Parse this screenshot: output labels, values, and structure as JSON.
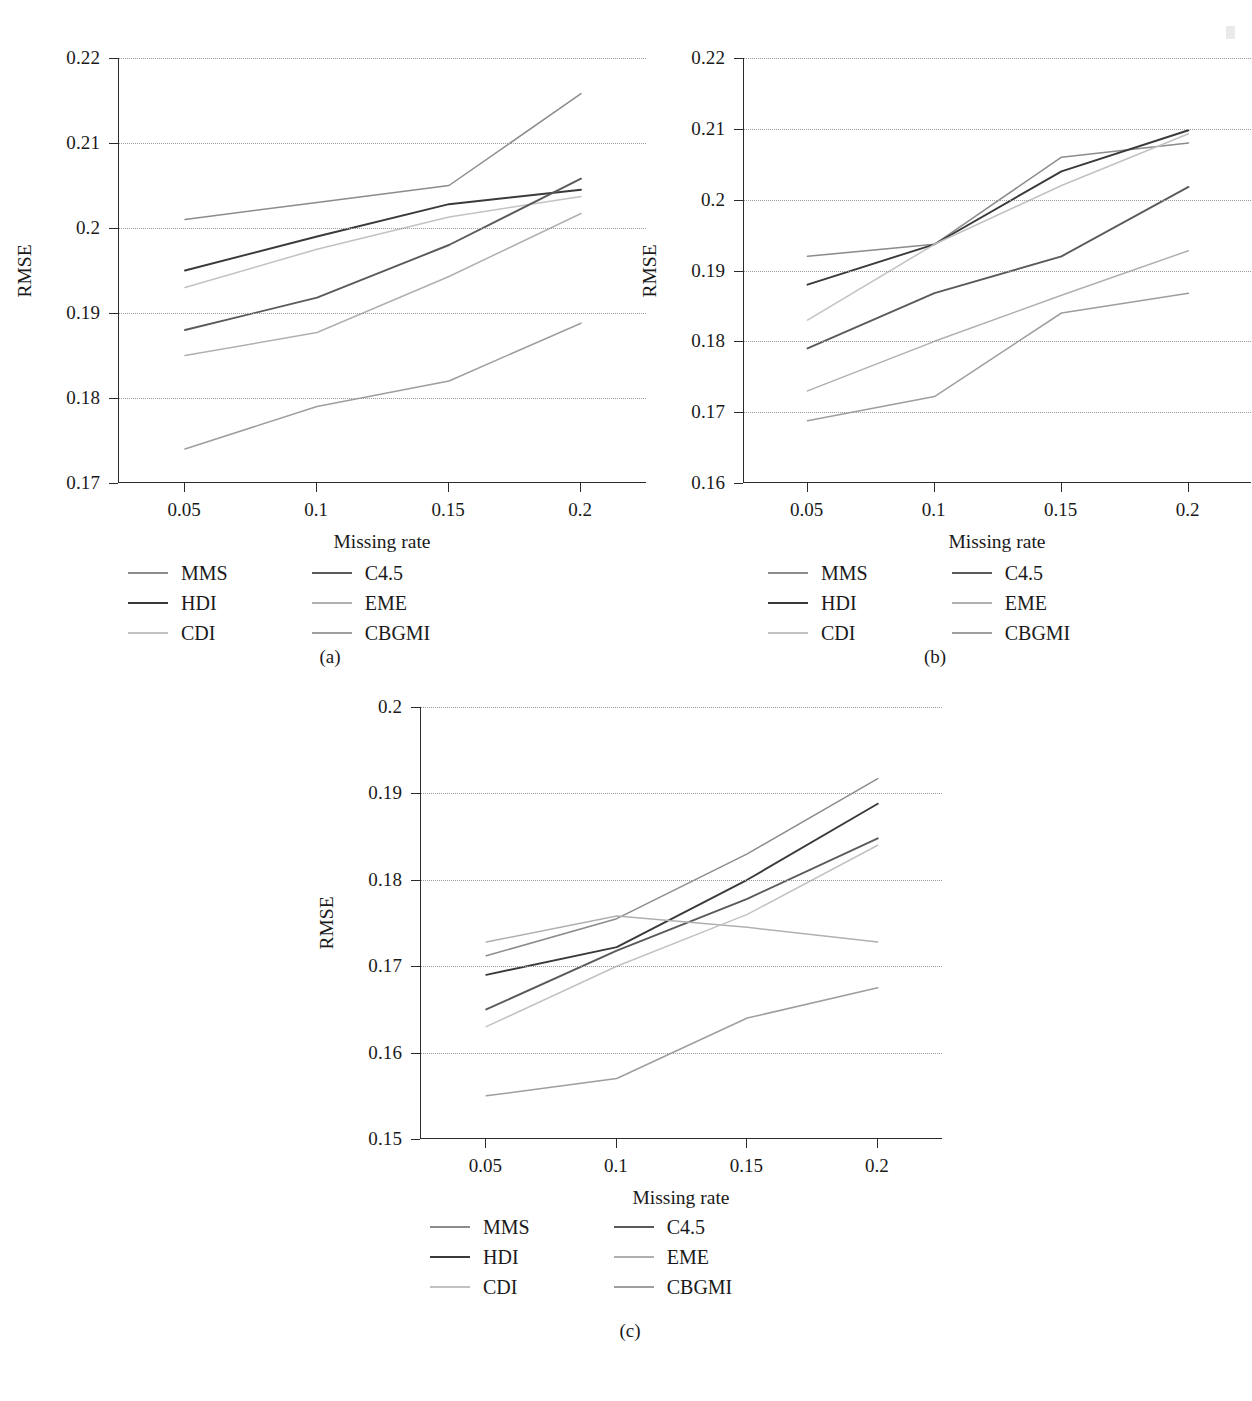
{
  "figure": {
    "axis_titles": {
      "x": "Missing rate",
      "y": "RMSE"
    },
    "series_names": [
      "MMS",
      "HDI",
      "CDI",
      "C4.5",
      "EME",
      "CBGMI"
    ],
    "series_colors": {
      "MMS": "#8c8c8c",
      "HDI": "#3a3a3a",
      "CDI": "#c2c2c2",
      "C4.5": "#5a5a5a",
      "EME": "#b0b0b0",
      "CBGMI": "#9e9e9e"
    },
    "legend": {
      "column_left": [
        "MMS",
        "HDI",
        "CDI"
      ],
      "column_right": [
        "C4.5",
        "EME",
        "CBGMI"
      ]
    },
    "captions": {
      "a": "(a)",
      "b": "(b)",
      "c": "(c)"
    }
  },
  "chart_data": [
    {
      "id": "a",
      "type": "line",
      "title": "",
      "caption": "(a)",
      "xlabel": "Missing rate",
      "ylabel": "RMSE",
      "x": [
        0.05,
        0.1,
        0.15,
        0.2
      ],
      "xtick_labels": [
        "0.05",
        "0.1",
        "0.15",
        "0.2"
      ],
      "xlim": [
        0.025,
        0.225
      ],
      "ylim": [
        0.17,
        0.22
      ],
      "ytick_labels": [
        "0.17",
        "0.18",
        "0.19",
        "0.2",
        "0.21",
        "0.22"
      ],
      "yticks": [
        0.17,
        0.18,
        0.19,
        0.2,
        0.21,
        0.22
      ],
      "grid": true,
      "grid_style": "dotted-horizontal",
      "legend_position": "below-plot",
      "series": [
        {
          "name": "MMS",
          "values": [
            0.201,
            0.203,
            0.205,
            0.2158
          ]
        },
        {
          "name": "HDI",
          "values": [
            0.195,
            0.199,
            0.2028,
            0.2045
          ]
        },
        {
          "name": "CDI",
          "values": [
            0.193,
            0.1975,
            0.2013,
            0.2037
          ]
        },
        {
          "name": "C4.5",
          "values": [
            0.188,
            0.1918,
            0.198,
            0.2058
          ]
        },
        {
          "name": "EME",
          "values": [
            0.185,
            0.1877,
            0.1943,
            0.2017
          ]
        },
        {
          "name": "CBGMI",
          "values": [
            0.174,
            0.179,
            0.182,
            0.1888
          ]
        }
      ]
    },
    {
      "id": "b",
      "type": "line",
      "title": "",
      "caption": "(b)",
      "xlabel": "Missing rate",
      "ylabel": "RMSE",
      "x": [
        0.05,
        0.1,
        0.15,
        0.2
      ],
      "xtick_labels": [
        "0.05",
        "0.1",
        "0.15",
        "0.2"
      ],
      "xlim": [
        0.025,
        0.225
      ],
      "ylim": [
        0.16,
        0.22
      ],
      "ytick_labels": [
        "0.16",
        "0.17",
        "0.18",
        "0.19",
        "0.2",
        "0.21",
        "0.22"
      ],
      "yticks": [
        0.16,
        0.17,
        0.18,
        0.19,
        0.2,
        0.21,
        0.22
      ],
      "grid": true,
      "grid_style": "dotted-horizontal",
      "legend_position": "below-plot",
      "series": [
        {
          "name": "MMS",
          "values": [
            0.192,
            0.1937,
            0.206,
            0.208
          ]
        },
        {
          "name": "HDI",
          "values": [
            0.188,
            0.1937,
            0.204,
            0.2098
          ]
        },
        {
          "name": "CDI",
          "values": [
            0.183,
            0.1937,
            0.202,
            0.2093
          ]
        },
        {
          "name": "C4.5",
          "values": [
            0.179,
            0.1868,
            0.192,
            0.2018
          ]
        },
        {
          "name": "EME",
          "values": [
            0.173,
            0.18,
            0.1865,
            0.1928
          ]
        },
        {
          "name": "CBGMI",
          "values": [
            0.1688,
            0.1722,
            0.184,
            0.1868
          ]
        }
      ]
    },
    {
      "id": "c",
      "type": "line",
      "title": "",
      "caption": "(c)",
      "xlabel": "Missing rate",
      "ylabel": "RMSE",
      "x": [
        0.05,
        0.1,
        0.15,
        0.2
      ],
      "xtick_labels": [
        "0.05",
        "0.1",
        "0.15",
        "0.2"
      ],
      "xlim": [
        0.025,
        0.225
      ],
      "ylim": [
        0.15,
        0.2
      ],
      "ytick_labels": [
        "0.15",
        "0.16",
        "0.17",
        "0.18",
        "0.19",
        "0.2"
      ],
      "yticks": [
        0.15,
        0.16,
        0.17,
        0.18,
        0.19,
        0.2
      ],
      "grid": true,
      "grid_style": "dotted-horizontal",
      "legend_position": "below-plot",
      "series": [
        {
          "name": "MMS",
          "values": [
            0.1712,
            0.1755,
            0.183,
            0.1917
          ]
        },
        {
          "name": "HDI",
          "values": [
            0.169,
            0.1722,
            0.18,
            0.1888
          ]
        },
        {
          "name": "C4.5",
          "values": [
            0.165,
            0.1718,
            0.1778,
            0.1848
          ]
        },
        {
          "name": "EME",
          "values": [
            0.1728,
            0.1758,
            0.1745,
            0.1728
          ]
        },
        {
          "name": "CDI",
          "values": [
            0.163,
            0.17,
            0.176,
            0.184
          ]
        },
        {
          "name": "CBGMI",
          "values": [
            0.155,
            0.157,
            0.164,
            0.1675
          ]
        }
      ]
    }
  ]
}
